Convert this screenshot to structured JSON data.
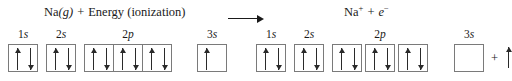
{
  "equation": {
    "reactant_species": "Na",
    "reactant_state": "(g)",
    "plus_left": "+",
    "energy_term": "Energy (ionization)",
    "arrow": "right-arrow",
    "product_ion": "Na",
    "product_ion_charge": "+",
    "plus_right": "+",
    "product_electron": "e",
    "product_electron_charge": "−"
  },
  "atom_config": {
    "caption": "Na atom ground-state orbital diagram",
    "subshells": [
      {
        "label_number": "1",
        "label_letter": "s",
        "boxes": [
          {
            "electrons": [
              "up",
              "down"
            ]
          }
        ],
        "spacing": "contiguous"
      },
      {
        "label_number": "2",
        "label_letter": "s",
        "boxes": [
          {
            "electrons": [
              "up",
              "down"
            ]
          }
        ],
        "spacing": "contiguous"
      },
      {
        "label_number": "2",
        "label_letter": "p",
        "boxes": [
          {
            "electrons": [
              "up",
              "down"
            ]
          },
          {
            "electrons": [
              "up",
              "down"
            ]
          },
          {
            "electrons": [
              "up",
              "down"
            ]
          }
        ],
        "spacing": "contiguous"
      },
      {
        "label_number": "3",
        "label_letter": "s",
        "boxes": [
          {
            "electrons": [
              "up"
            ]
          }
        ],
        "spacing": "contiguous"
      }
    ]
  },
  "ion_config": {
    "caption": "Na+ ion orbital diagram with ejected electron",
    "subshells": [
      {
        "label_number": "1",
        "label_letter": "s",
        "boxes": [
          {
            "electrons": [
              "up",
              "down"
            ]
          }
        ],
        "spacing": "contiguous"
      },
      {
        "label_number": "2",
        "label_letter": "s",
        "boxes": [
          {
            "electrons": [
              "up",
              "down"
            ]
          }
        ],
        "spacing": "contiguous"
      },
      {
        "label_number": "2",
        "label_letter": "p",
        "boxes": [
          {
            "electrons": [
              "up",
              "down"
            ]
          },
          {
            "electrons": [
              "up",
              "down"
            ]
          },
          {
            "electrons": [
              "up",
              "down"
            ]
          }
        ],
        "spacing": "spaced"
      },
      {
        "label_number": "3",
        "label_letter": "s",
        "boxes": [
          {
            "electrons": []
          }
        ],
        "spacing": "contiguous"
      }
    ],
    "ejected_plus": "+",
    "ejected_electron": "up"
  },
  "colors": {
    "ink": "#1a1a1a",
    "box_border": "#7a7a7a",
    "arrow": "#2a2a2a",
    "background": "#ffffff"
  }
}
